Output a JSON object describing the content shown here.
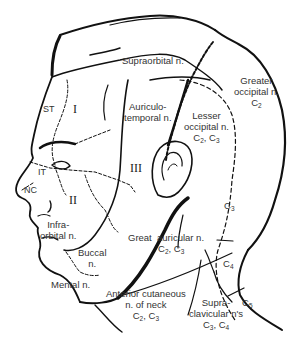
{
  "diagram": {
    "colors": {
      "line": "#111111",
      "text": "#333333",
      "background": "#ffffff"
    },
    "labels": {
      "supraorbital": "Supraorbital n.",
      "greater_occipital": {
        "line1": "Greater",
        "line2": "occipital n.",
        "line3": "C",
        "sub": "2"
      },
      "auriculotemporal": {
        "line1": "Auriculo-",
        "line2": "temporal n."
      },
      "lesser_occipital": {
        "line1": "Lesser",
        "line2": "occipital n.",
        "c_a": "C",
        "sub_a": "2",
        "sep": ", ",
        "c_b": "C",
        "sub_b": "3"
      },
      "st": "ST",
      "region_i": "I",
      "region_ii": "II",
      "region_iii": "III",
      "it": "IT",
      "nc": "NC",
      "infraorbital": {
        "line1": "Infra-",
        "line2": "orbital n."
      },
      "buccal": {
        "line1": "Buccal",
        "line2": "n."
      },
      "mental": "Mental n.",
      "great_auricular": {
        "line1a": "Great",
        "line1b": "auricular n.",
        "c_a": "C",
        "sub_a": "2",
        "sep": ", ",
        "c_b": "C",
        "sub_b": "3"
      },
      "anterior_cutaneous": {
        "line1": "Anterior cutaneous",
        "line2": "n. of neck",
        "c_a": "C",
        "sub_a": "2",
        "sep": ", ",
        "c_b": "C",
        "sub_b": "3"
      },
      "supraclavicular": {
        "line1": "Supra-",
        "line2": "clavicular n's",
        "c_a": "C",
        "sub_a": "3",
        "sep": ", ",
        "c_b": "C",
        "sub_b": "4"
      },
      "c3": {
        "c": "C",
        "sub": "3"
      },
      "c4": {
        "c": "C",
        "sub": "4"
      },
      "c5": {
        "c": "C",
        "sub": "5"
      }
    }
  }
}
